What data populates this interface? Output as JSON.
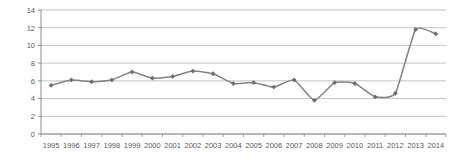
{
  "chart_data": {
    "type": "line",
    "title": "",
    "subtitle": "",
    "xlabel": "",
    "ylabel": "",
    "categories": [
      "1995",
      "1996",
      "1997",
      "1998",
      "1999",
      "2000",
      "2001",
      "2002",
      "2003",
      "2004",
      "2005",
      "2006",
      "2007",
      "2008",
      "2009",
      "2010",
      "2011",
      "2012",
      "2013",
      "2014"
    ],
    "values": [
      5.5,
      6.1,
      5.9,
      6.1,
      7.0,
      6.3,
      6.5,
      7.1,
      6.8,
      5.7,
      5.8,
      5.3,
      6.1,
      3.8,
      5.8,
      5.7,
      4.2,
      4.6,
      11.8,
      11.3
    ],
    "series": [
      {
        "name": "series-1",
        "values": [
          5.5,
          6.1,
          5.9,
          6.1,
          7.0,
          6.3,
          6.5,
          7.1,
          6.8,
          5.7,
          5.8,
          5.3,
          6.1,
          3.8,
          5.8,
          5.7,
          4.2,
          4.6,
          11.8,
          11.3
        ]
      }
    ],
    "ylim": [
      0,
      14
    ],
    "yticks": [
      0,
      2,
      4,
      6,
      8,
      10,
      12,
      14
    ],
    "ytick_labels": [
      "0",
      "2",
      "4",
      "6",
      "8",
      "10",
      "12",
      "14"
    ],
    "xtick_labels": [
      "1995",
      "1996",
      "1997",
      "1998",
      "1999",
      "2000",
      "2001",
      "2002",
      "2003",
      "2004",
      "2005",
      "2006",
      "2007",
      "2008",
      "2009",
      "2010",
      "2011",
      "2012",
      "2013",
      "2014"
    ],
    "grid": true,
    "grid_axis": "y",
    "legend": false,
    "legend_position": "none",
    "marker": "diamond",
    "smoothing": true,
    "colors": {
      "line": "#808285",
      "marker": "#6d6e71",
      "grid": "#a7a9ac",
      "axis": "#808285",
      "tick_label": "#58585a",
      "background": "#ffffff"
    }
  }
}
